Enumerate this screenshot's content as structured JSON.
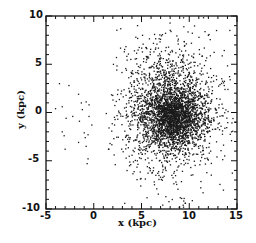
{
  "chart_data": {
    "type": "scatter",
    "title": "",
    "xlabel": "x (kpc)",
    "ylabel": "y (kpc)",
    "xlim": [
      -5,
      15
    ],
    "ylim": [
      -10,
      10
    ],
    "xticks": [
      -5,
      0,
      5,
      10,
      15
    ],
    "yticks": [
      -10,
      -5,
      0,
      5,
      10
    ],
    "xtick_labels": [
      "-5",
      "0",
      "5",
      "10",
      "15"
    ],
    "ytick_labels": [
      "-10",
      "-5",
      "0",
      "5",
      "10"
    ],
    "minor_ticks_per_major": 5,
    "grid": false,
    "legend": null,
    "marker_color": "#1a1a1a",
    "series": [
      {
        "name": "dense core",
        "distribution": "gaussian",
        "center": [
          8.3,
          -0.6
        ],
        "sigma": [
          1.4,
          1.3
        ],
        "count": 1300
      },
      {
        "name": "main cloud",
        "distribution": "gaussian",
        "center": [
          8.0,
          0.2
        ],
        "sigma": [
          2.3,
          3.0
        ],
        "count": 1700
      },
      {
        "name": "sparse halo",
        "distribution": "gaussian",
        "center": [
          8.0,
          0.5
        ],
        "sigma": [
          3.2,
          4.2
        ],
        "count": 500
      },
      {
        "name": "outliers",
        "distribution": "explicit",
        "points": [
          [
            -3.6,
            3.0
          ],
          [
            -2.6,
            2.8
          ],
          [
            -1.6,
            1.9
          ],
          [
            -4.0,
            0.4
          ],
          [
            -3.3,
            0.6
          ],
          [
            -1.3,
            1.0
          ],
          [
            -0.8,
            1.1
          ],
          [
            -0.5,
            0.8
          ],
          [
            -1.2,
            0.3
          ],
          [
            -2.2,
            -0.4
          ],
          [
            -2.9,
            -0.6
          ],
          [
            -1.5,
            -0.9
          ],
          [
            -0.5,
            -0.4
          ],
          [
            -0.2,
            -1.3
          ],
          [
            -1.0,
            -2.1
          ],
          [
            -3.3,
            -2.0
          ],
          [
            -3.1,
            -2.4
          ],
          [
            -0.9,
            -2.6
          ],
          [
            -0.6,
            -2.3
          ],
          [
            -1.6,
            -3.1
          ],
          [
            -0.8,
            -3.5
          ],
          [
            -3.0,
            -3.8
          ],
          [
            -0.6,
            -4.8
          ],
          [
            -0.7,
            -5.3
          ],
          [
            1.3,
            -0.1
          ],
          [
            2.4,
            4.4
          ],
          [
            3.2,
            6.3
          ],
          [
            4.4,
            7.8
          ],
          [
            5.1,
            8.0
          ],
          [
            2.0,
            1.3
          ],
          [
            1.6,
            -1.6
          ],
          [
            2.1,
            -2.7
          ],
          [
            11.2,
            -7.8
          ],
          [
            9.2,
            -8.9
          ],
          [
            9.6,
            -9.4
          ],
          [
            9.4,
            -9.8
          ],
          [
            10.2,
            -6.5
          ],
          [
            8.6,
            -7.2
          ],
          [
            12.9,
            -4.6
          ],
          [
            13.4,
            3.5
          ]
        ]
      }
    ]
  },
  "axes": {
    "x_tick_labels": [
      "-5",
      "0",
      "5",
      "10",
      "15"
    ],
    "y_tick_labels": [
      "10",
      "5",
      "0",
      "-5",
      "-10"
    ],
    "xlabel": "x (kpc)",
    "ylabel": "y (kpc)"
  }
}
